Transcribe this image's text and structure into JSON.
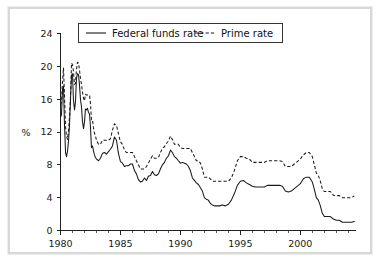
{
  "chart_data": {
    "type": "line",
    "title": "",
    "subtitle": "",
    "xlabel": "",
    "ylabel": "%",
    "xlim": [
      1980,
      2004.6
    ],
    "ylim": [
      0,
      24
    ],
    "grid": false,
    "legend_position": "top-center",
    "y_ticks": [
      0,
      4,
      8,
      12,
      16,
      20,
      24
    ],
    "y_tick_labels": [
      "0",
      "4",
      "8",
      "12",
      "16",
      "20",
      "24"
    ],
    "x_ticks": [
      1980,
      1985,
      1990,
      1995,
      2000
    ],
    "x_tick_labels": [
      "1980",
      "1985",
      "1990",
      "1995",
      "2000"
    ],
    "x_minor_tick_step": 1,
    "series": [
      {
        "name": "Federal funds rate",
        "style": "solid",
        "color": "#1a1a1a",
        "x": [
          1980.0,
          1980.08,
          1980.17,
          1980.25,
          1980.33,
          1980.42,
          1980.5,
          1980.58,
          1980.67,
          1980.75,
          1980.83,
          1980.92,
          1981.0,
          1981.08,
          1981.17,
          1981.25,
          1981.33,
          1981.42,
          1981.5,
          1981.58,
          1981.67,
          1981.75,
          1981.83,
          1981.92,
          1982.0,
          1982.08,
          1982.17,
          1982.25,
          1982.33,
          1982.42,
          1982.5,
          1982.58,
          1982.67,
          1982.75,
          1982.83,
          1982.92,
          1983.0,
          1983.17,
          1983.33,
          1983.5,
          1983.67,
          1983.83,
          1984.0,
          1984.17,
          1984.33,
          1984.5,
          1984.67,
          1984.83,
          1985.0,
          1985.17,
          1985.33,
          1985.5,
          1985.67,
          1985.83,
          1986.0,
          1986.17,
          1986.33,
          1986.5,
          1986.67,
          1986.83,
          1987.0,
          1987.17,
          1987.33,
          1987.5,
          1987.67,
          1987.83,
          1988.0,
          1988.17,
          1988.33,
          1988.5,
          1988.67,
          1988.83,
          1989.0,
          1989.17,
          1989.33,
          1989.5,
          1989.67,
          1989.83,
          1990.0,
          1990.17,
          1990.33,
          1990.5,
          1990.67,
          1990.83,
          1991.0,
          1991.17,
          1991.33,
          1991.5,
          1991.67,
          1991.83,
          1992.0,
          1992.17,
          1992.33,
          1992.5,
          1992.67,
          1992.83,
          1993.0,
          1993.25,
          1993.5,
          1993.75,
          1994.0,
          1994.25,
          1994.5,
          1994.75,
          1995.0,
          1995.25,
          1995.5,
          1995.75,
          1996.0,
          1996.25,
          1996.5,
          1996.75,
          1997.0,
          1997.25,
          1997.5,
          1997.75,
          1998.0,
          1998.25,
          1998.5,
          1998.75,
          1999.0,
          1999.25,
          1999.5,
          1999.75,
          2000.0,
          2000.25,
          2000.5,
          2000.75,
          2001.0,
          2001.17,
          2001.33,
          2001.5,
          2001.67,
          2001.83,
          2002.0,
          2002.25,
          2002.5,
          2002.75,
          2003.0,
          2003.25,
          2003.5,
          2003.75,
          2004.0,
          2004.25,
          2004.5
        ],
        "values": [
          13.8,
          14.1,
          17.2,
          17.6,
          13.0,
          9.5,
          9.0,
          9.6,
          10.9,
          12.8,
          15.8,
          18.9,
          19.1,
          15.9,
          14.7,
          15.7,
          18.5,
          19.1,
          19.0,
          17.8,
          15.9,
          15.1,
          13.3,
          12.4,
          13.2,
          14.8,
          14.7,
          14.9,
          14.4,
          14.2,
          12.6,
          10.1,
          10.3,
          9.7,
          9.2,
          8.9,
          8.7,
          8.5,
          8.8,
          9.4,
          9.5,
          9.3,
          9.6,
          9.9,
          10.3,
          11.4,
          11.0,
          9.4,
          8.4,
          8.2,
          7.8,
          7.9,
          7.9,
          8.1,
          8.1,
          7.3,
          6.9,
          6.2,
          5.9,
          6.0,
          6.4,
          6.1,
          6.6,
          6.7,
          7.2,
          6.8,
          6.7,
          6.9,
          7.5,
          8.0,
          8.3,
          8.8,
          9.1,
          9.8,
          9.5,
          9.0,
          8.8,
          8.5,
          8.2,
          8.3,
          8.2,
          8.1,
          7.8,
          7.3,
          6.4,
          6.1,
          5.8,
          5.6,
          5.2,
          4.8,
          4.0,
          3.8,
          3.7,
          3.3,
          3.1,
          3.0,
          3.0,
          3.0,
          3.1,
          3.0,
          3.2,
          3.7,
          4.5,
          5.5,
          6.0,
          6.1,
          5.8,
          5.6,
          5.4,
          5.3,
          5.3,
          5.3,
          5.3,
          5.5,
          5.5,
          5.5,
          5.5,
          5.5,
          5.4,
          4.8,
          4.7,
          4.8,
          5.1,
          5.4,
          5.7,
          6.3,
          6.5,
          6.5,
          5.9,
          5.0,
          4.0,
          3.7,
          3.0,
          2.1,
          1.7,
          1.7,
          1.7,
          1.4,
          1.25,
          1.25,
          1.0,
          1.0,
          1.0,
          1.0,
          1.1
        ]
      },
      {
        "name": "Prime rate",
        "style": "dashed",
        "color": "#1a1a1a",
        "x": [
          1980.0,
          1980.08,
          1980.17,
          1980.25,
          1980.33,
          1980.42,
          1980.5,
          1980.58,
          1980.67,
          1980.75,
          1980.83,
          1980.92,
          1981.0,
          1981.08,
          1981.17,
          1981.25,
          1981.33,
          1981.42,
          1981.5,
          1981.58,
          1981.67,
          1981.75,
          1981.83,
          1981.92,
          1982.0,
          1982.08,
          1982.17,
          1982.25,
          1982.33,
          1982.42,
          1982.5,
          1982.58,
          1982.67,
          1982.75,
          1982.83,
          1982.92,
          1983.0,
          1983.17,
          1983.33,
          1983.5,
          1983.67,
          1983.83,
          1984.0,
          1984.17,
          1984.33,
          1984.5,
          1984.67,
          1984.83,
          1985.0,
          1985.17,
          1985.33,
          1985.5,
          1985.67,
          1985.83,
          1986.0,
          1986.17,
          1986.33,
          1986.5,
          1986.67,
          1986.83,
          1987.0,
          1987.17,
          1987.33,
          1987.5,
          1987.67,
          1987.83,
          1988.0,
          1988.17,
          1988.33,
          1988.5,
          1988.67,
          1988.83,
          1989.0,
          1989.17,
          1989.33,
          1989.5,
          1989.67,
          1989.83,
          1990.0,
          1990.17,
          1990.33,
          1990.5,
          1990.67,
          1990.83,
          1991.0,
          1991.17,
          1991.33,
          1991.5,
          1991.67,
          1991.83,
          1992.0,
          1992.17,
          1992.33,
          1992.5,
          1992.67,
          1992.83,
          1993.0,
          1993.25,
          1993.5,
          1993.75,
          1994.0,
          1994.25,
          1994.5,
          1994.75,
          1995.0,
          1995.25,
          1995.5,
          1995.75,
          1996.0,
          1996.25,
          1996.5,
          1996.75,
          1997.0,
          1997.25,
          1997.5,
          1997.75,
          1998.0,
          1998.25,
          1998.5,
          1998.75,
          1999.0,
          1999.25,
          1999.5,
          1999.75,
          2000.0,
          2000.25,
          2000.5,
          2000.75,
          2001.0,
          2001.17,
          2001.33,
          2001.5,
          2001.67,
          2001.83,
          2002.0,
          2002.25,
          2002.5,
          2002.75,
          2003.0,
          2003.25,
          2003.5,
          2003.75,
          2004.0,
          2004.25,
          2004.5
        ],
        "values": [
          15.3,
          15.6,
          18.3,
          19.8,
          16.6,
          12.6,
          11.5,
          11.1,
          12.2,
          13.8,
          16.1,
          20.4,
          20.2,
          19.4,
          17.8,
          17.9,
          19.6,
          20.5,
          20.4,
          19.6,
          18.5,
          17.8,
          16.9,
          16.1,
          15.8,
          16.6,
          16.5,
          16.5,
          16.5,
          16.5,
          15.5,
          13.5,
          13.5,
          12.5,
          11.9,
          11.5,
          11.0,
          10.5,
          10.5,
          11.0,
          11.0,
          11.0,
          11.0,
          11.2,
          12.2,
          13.0,
          12.8,
          11.8,
          10.8,
          10.5,
          9.8,
          9.5,
          9.5,
          9.5,
          9.5,
          9.0,
          8.5,
          8.0,
          7.5,
          7.5,
          7.5,
          7.8,
          8.2,
          8.7,
          9.1,
          8.8,
          8.8,
          8.9,
          9.5,
          10.0,
          10.2,
          10.6,
          10.9,
          11.5,
          11.1,
          10.5,
          10.5,
          10.5,
          10.1,
          10.0,
          10.0,
          10.0,
          10.0,
          10.0,
          9.5,
          9.0,
          8.5,
          8.5,
          8.2,
          7.5,
          6.5,
          6.5,
          6.5,
          6.3,
          6.0,
          6.0,
          6.0,
          6.0,
          6.0,
          6.0,
          6.0,
          6.4,
          7.3,
          8.5,
          9.0,
          9.0,
          8.8,
          8.7,
          8.3,
          8.3,
          8.3,
          8.3,
          8.3,
          8.5,
          8.5,
          8.5,
          8.5,
          8.5,
          8.4,
          7.8,
          7.8,
          7.8,
          8.1,
          8.4,
          8.7,
          9.2,
          9.5,
          9.5,
          9.0,
          8.0,
          7.0,
          6.7,
          6.0,
          5.1,
          4.75,
          4.75,
          4.75,
          4.3,
          4.25,
          4.25,
          4.0,
          4.0,
          4.0,
          4.0,
          4.2
        ]
      }
    ],
    "legend": [
      {
        "label": "Federal funds rate",
        "style": "solid"
      },
      {
        "label": "Prime rate",
        "style": "dashed"
      }
    ]
  }
}
